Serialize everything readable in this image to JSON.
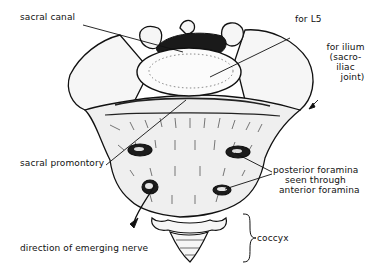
{
  "figure": {
    "colors": {
      "background": "#ffffff",
      "ink": "#111111",
      "bone_fill": "#f4f4f4",
      "shadow": "#222222"
    }
  },
  "labels": {
    "sacral_canal": "sacral canal",
    "for_l5": "for L5",
    "for_ilium": [
      "for ilium",
      "(sacro-",
      "iliac",
      "joint)"
    ],
    "sacral_promontory": "sacral promontory",
    "posterior_foramina": [
      "posterior foramina",
      "seen through",
      "anterior foramina"
    ],
    "coccyx": "coccyx",
    "direction_nerve": "direction of emerging nerve"
  }
}
